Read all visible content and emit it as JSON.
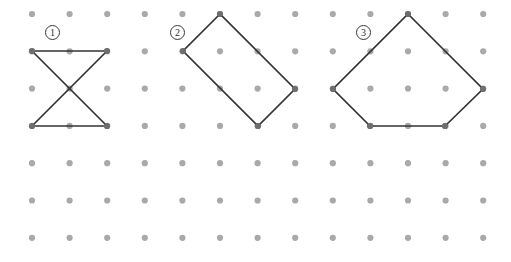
{
  "page": {
    "background_color": "#ffffff",
    "width": 511,
    "height": 262
  },
  "grid": {
    "dot_color": "#a9a9a9",
    "dot_radius": 3.1,
    "origin_x": 32,
    "origin_y": 14,
    "spacing_x": 37.6,
    "spacing_y": 37.3,
    "columns": 13,
    "rows": 7
  },
  "figures": [
    {
      "id": "figure-1",
      "label": "1",
      "label_x": 45,
      "label_y": 25,
      "shape_name": "bowtie-hourglass",
      "stroke_color": "#333333",
      "stroke_width": 1.7,
      "segments": [
        {
          "x1": 32,
          "y1": 51,
          "x2": 107,
          "y2": 51
        },
        {
          "x1": 32,
          "y1": 126,
          "x2": 107,
          "y2": 126
        },
        {
          "x1": 32,
          "y1": 51,
          "x2": 107,
          "y2": 126
        },
        {
          "x1": 107,
          "y1": 51,
          "x2": 32,
          "y2": 126
        }
      ],
      "vertices": [
        {
          "x": 32,
          "y": 51
        },
        {
          "x": 107,
          "y": 51
        },
        {
          "x": 32,
          "y": 126
        },
        {
          "x": 107,
          "y": 126
        }
      ]
    },
    {
      "id": "figure-2",
      "label": "2",
      "label_x": 170,
      "label_y": 25,
      "shape_name": "tilted-rectangle",
      "stroke_color": "#333333",
      "stroke_width": 1.7,
      "polygon_points": "220,14 183,51 258,126 295,89",
      "vertices": [
        {
          "x": 220,
          "y": 14
        },
        {
          "x": 183,
          "y": 51
        },
        {
          "x": 258,
          "y": 126
        },
        {
          "x": 295,
          "y": 89
        }
      ]
    },
    {
      "id": "figure-3",
      "label": "3",
      "label_x": 356,
      "label_y": 25,
      "shape_name": "pentagon",
      "stroke_color": "#333333",
      "stroke_width": 1.7,
      "polygon_points": "408,14 483,89 445,126 370,126 333,89",
      "vertices": [
        {
          "x": 408,
          "y": 14
        },
        {
          "x": 483,
          "y": 89
        },
        {
          "x": 445,
          "y": 126
        },
        {
          "x": 370,
          "y": 126
        },
        {
          "x": 333,
          "y": 89
        }
      ]
    }
  ]
}
